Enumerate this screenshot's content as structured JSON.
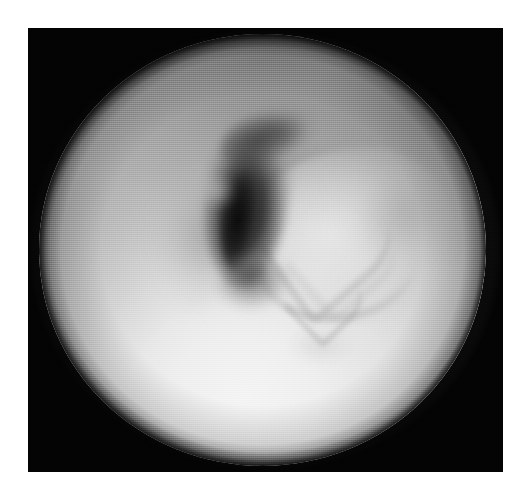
{
  "figure": {
    "kind": "endoscopic-photograph",
    "modality": "endoscopy",
    "color_mode": "grayscale",
    "orientation": "landscape",
    "caption": "",
    "label": "",
    "frame": {
      "background_color": "#ffffff",
      "plate_color": "#151515",
      "plate_left": 28,
      "plate_top": 28,
      "plate_width": 475,
      "plate_height": 444,
      "grain": "halftone-print-screen"
    },
    "field_of_view": {
      "shape": "circle",
      "center_x_px": 262,
      "center_y_px": 250,
      "radius_x_px": 223,
      "radius_y_px": 216,
      "mask_color": "#151515"
    },
    "illumination": {
      "bright_region": "lower-centre",
      "bright_value": "#f4f4f4",
      "mid_value": "#cfcfcf",
      "shadow_value": "#8a8a8a",
      "darkest_value": "#111111"
    },
    "regions": [
      {
        "name": "lumen-slit",
        "description": "dark vertical slit-like lumen running from upper centre downward",
        "tone": "darkest",
        "hex": "#121212"
      },
      {
        "name": "lumen-hook",
        "description": "dark hook curving to the upper right from the slit",
        "tone": "dark",
        "hex": "#3a3a3a"
      },
      {
        "name": "soft-tissue-mass",
        "description": "rounded pale mass bulging from the right of the lumen with chevron folds",
        "tone": "bright",
        "hex": "#eaeaea"
      },
      {
        "name": "mucosal-fold-chevron",
        "description": "V-shaped fold crease across the mass",
        "tone": "mid",
        "hex": "#9a9a9a"
      },
      {
        "name": "lower-wall",
        "description": "broad bright foreground wall filling the lower half of the field",
        "tone": "brightest",
        "hex": "#f2f2f2"
      },
      {
        "name": "upper-wall",
        "description": "mid-gray shaded wall across the upper field",
        "tone": "mid",
        "hex": "#b4b4b4"
      }
    ]
  }
}
